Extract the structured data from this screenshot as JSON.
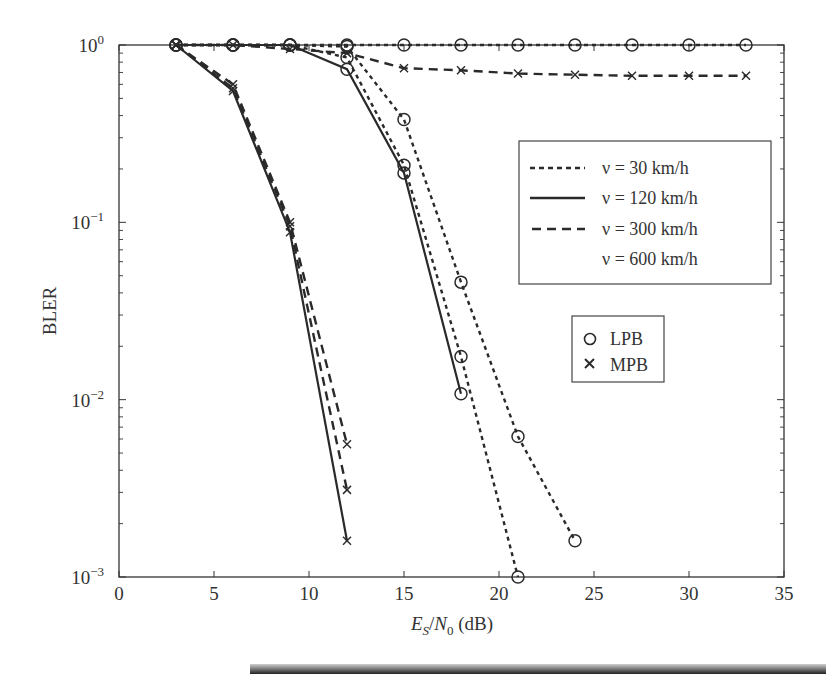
{
  "chart_data": {
    "type": "line",
    "title": "",
    "xlabel": "E_S/N_0 (dB)",
    "xlabel_parts": {
      "E": "E",
      "S": "S",
      "slash": "/",
      "N": "N",
      "zero": "0",
      "unit": " (dB)"
    },
    "ylabel": "BLER",
    "xlim": [
      0,
      35
    ],
    "ylim": [
      0.001,
      1
    ],
    "yscale": "log",
    "grid": false,
    "x_ticks": [
      0,
      5,
      10,
      15,
      20,
      25,
      30,
      35
    ],
    "x_tick_labels": [
      "0",
      "5",
      "10",
      "15",
      "20",
      "25",
      "30",
      "35"
    ],
    "y_ticks": [
      1,
      0.1,
      0.01,
      0.001
    ],
    "y_tick_labels": [
      {
        "base": "10",
        "exp": "0"
      },
      {
        "base": "10",
        "exp": "−1"
      },
      {
        "base": "10",
        "exp": "−2"
      },
      {
        "base": "10",
        "exp": "−3"
      }
    ],
    "legend_speed": {
      "position": "upper right",
      "entries": [
        {
          "label": "ν = 30 km/h",
          "style": "dotted"
        },
        {
          "label": "ν = 120 km/h",
          "style": "solid"
        },
        {
          "label": "ν = 300 km/h",
          "style": "dashed"
        },
        {
          "label": "ν = 600 km/h",
          "style": "none"
        }
      ]
    },
    "legend_marker": {
      "position": "center right",
      "entries": [
        {
          "label": "LPB",
          "marker": "circle"
        },
        {
          "label": "MPB",
          "marker": "x"
        }
      ]
    },
    "series": [
      {
        "name": "MPB v=120 km/h",
        "marker": "x",
        "style": "solid",
        "x": [
          3,
          6,
          9,
          12
        ],
        "y": [
          1.0,
          0.55,
          0.088,
          0.0016
        ]
      },
      {
        "name": "MPB v=30 km/h",
        "marker": "x",
        "style": "dashed",
        "x": [
          3,
          6,
          9,
          12
        ],
        "y": [
          1.0,
          0.57,
          0.095,
          0.0031
        ]
      },
      {
        "name": "MPB v=300 km/h",
        "marker": "x",
        "style": "dashed",
        "x": [
          3,
          6,
          9,
          12
        ],
        "y": [
          1.0,
          0.6,
          0.1,
          0.0056
        ]
      },
      {
        "name": "LPB v=120 km/h",
        "marker": "circle",
        "style": "solid",
        "x": [
          3,
          6,
          9,
          12,
          15,
          18
        ],
        "y": [
          1.0,
          1.0,
          1.0,
          0.73,
          0.19,
          0.0108
        ]
      },
      {
        "name": "LPB v=30 km/h",
        "marker": "circle",
        "style": "dotted",
        "x": [
          3,
          6,
          9,
          12,
          15,
          18,
          21
        ],
        "y": [
          1.0,
          1.0,
          1.0,
          0.85,
          0.21,
          0.0175,
          0.001
        ]
      },
      {
        "name": "LPB v=300 km/h",
        "marker": "circle",
        "style": "dotted",
        "x": [
          3,
          6,
          9,
          12,
          15,
          18,
          21,
          24
        ],
        "y": [
          1.0,
          1.0,
          1.0,
          0.98,
          0.38,
          0.046,
          0.0062,
          0.0016
        ]
      },
      {
        "name": "MPB v=600 km/h",
        "marker": "x",
        "style": "dashed",
        "x": [
          3,
          6,
          9,
          12,
          15,
          18,
          21,
          24,
          27,
          30,
          33
        ],
        "y": [
          1.0,
          1.0,
          0.95,
          0.9,
          0.74,
          0.72,
          0.69,
          0.68,
          0.67,
          0.67,
          0.67
        ]
      },
      {
        "name": "LPB v=600 km/h",
        "marker": "circle",
        "style": "dotted",
        "x": [
          3,
          6,
          9,
          12,
          15,
          18,
          21,
          24,
          27,
          30,
          33
        ],
        "y": [
          1.0,
          1.0,
          1.0,
          1.0,
          1.0,
          1.0,
          1.0,
          1.0,
          1.0,
          1.0,
          1.0
        ]
      }
    ],
    "colors": {
      "line": "#2a2a2a",
      "axis": "#333333",
      "background": "#ffffff"
    }
  }
}
